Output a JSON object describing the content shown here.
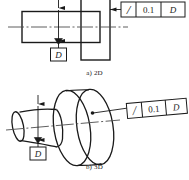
{
  "drawing": {
    "title": "Circular run-out tolerance on a stepped shaft",
    "line_color": "#1a1a1a",
    "centerline_color": "#4d4d4d",
    "background": "#ffffff"
  },
  "views": {
    "top": {
      "caption": "a) 2D",
      "type": "orthographic-front-view",
      "parts": [
        "shaft-rectangle",
        "flange-rectangle",
        "centerline"
      ]
    },
    "bottom": {
      "caption": "b) 3D",
      "type": "isometric-pictorial-view",
      "parts": [
        "shaft-cylinder",
        "flange-disc",
        "axis-centerline"
      ]
    }
  },
  "feature_control_frame_2d": {
    "symbol": "circular-runout-slash",
    "symbol_char": "/",
    "tolerance": "0.1",
    "datum": "D"
  },
  "feature_control_frame_3d": {
    "symbol": "circular-runout-slash",
    "symbol_char": "/",
    "tolerance": "0.1",
    "datum": "D"
  },
  "datum_feature_2d": {
    "letter": "D",
    "triangle": "filled"
  },
  "datum_feature_3d": {
    "letter": "D",
    "triangle": "filled"
  }
}
